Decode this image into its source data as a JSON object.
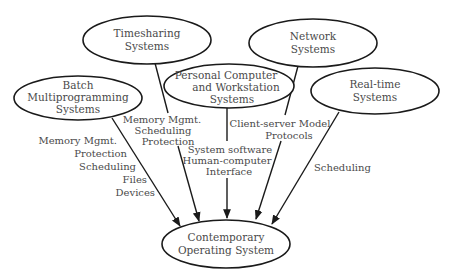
{
  "diagram": {
    "nodes": {
      "timesharing": {
        "lines": [
          "Timesharing",
          "Systems"
        ]
      },
      "network": {
        "lines": [
          "Network",
          "Systems"
        ]
      },
      "batch": {
        "lines": [
          "Batch",
          "Multiprogramming",
          "Systems"
        ]
      },
      "personal": {
        "lines": [
          "Personal Computer",
          "and Workstation",
          "Systems"
        ]
      },
      "realtime": {
        "lines": [
          "Real-time",
          "Systems"
        ]
      },
      "contemporary": {
        "lines": [
          "Contemporary",
          "Operating System"
        ]
      }
    },
    "edges": {
      "batch": {
        "from": "Batch Multiprogramming Systems",
        "to": "Contemporary Operating System",
        "labels": [
          "Memory Mgmt.",
          "Protection",
          "Scheduling",
          "Files",
          "Devices"
        ]
      },
      "timesharing": {
        "from": "Timesharing Systems",
        "to": "Contemporary Operating System",
        "labels": [
          "Memory Mgmt.",
          "Scheduling",
          "Protection"
        ]
      },
      "personal": {
        "from": "Personal Computer and Workstation Systems",
        "to": "Contemporary Operating System",
        "labels": [
          "System software",
          "Human-computer",
          "Interface"
        ]
      },
      "network": {
        "from": "Network Systems",
        "to": "Contemporary Operating System",
        "labels": [
          "Client-server Model",
          "Protocols"
        ]
      },
      "realtime": {
        "from": "Real-time Systems",
        "to": "Contemporary Operating System",
        "labels": [
          "Scheduling"
        ]
      }
    }
  }
}
